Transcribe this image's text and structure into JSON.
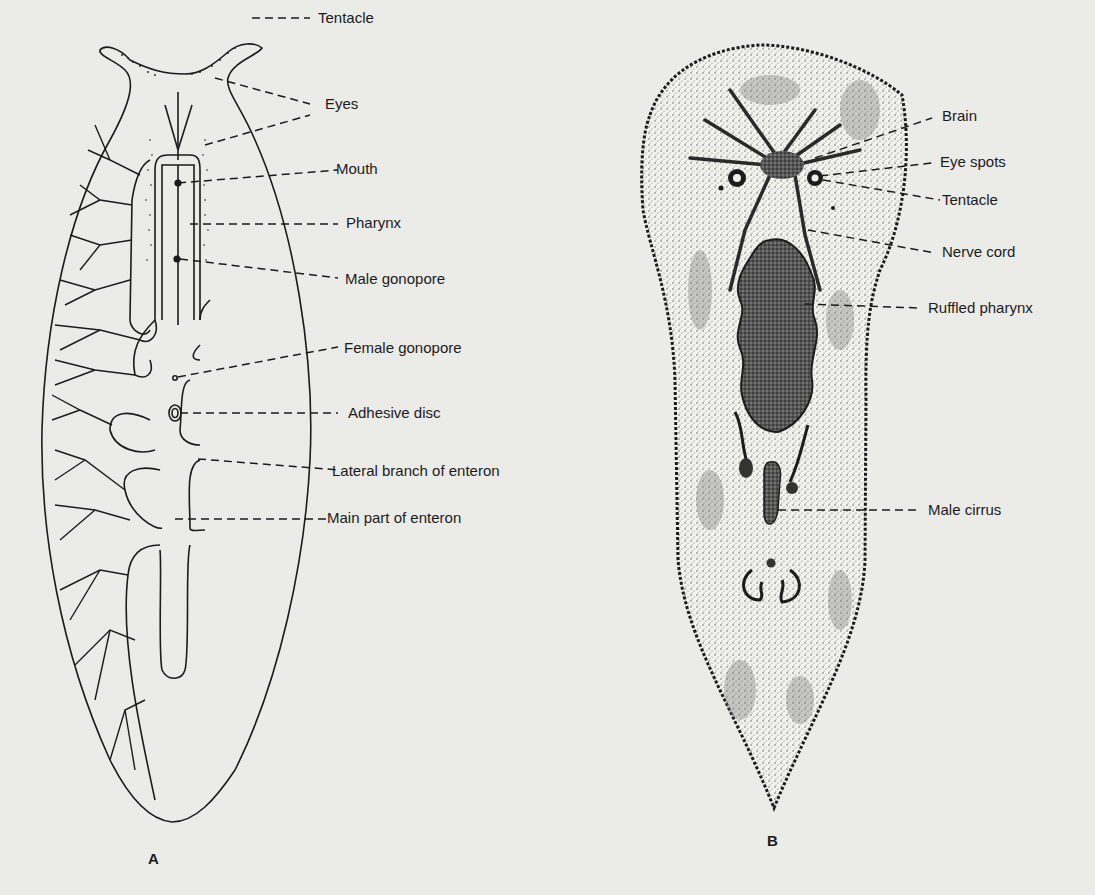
{
  "figure": {
    "panel_a": {
      "letter": "A",
      "labels": [
        {
          "id": "tentacle",
          "text": "Tentacle"
        },
        {
          "id": "eyes",
          "text": "Eyes"
        },
        {
          "id": "mouth",
          "text": "Mouth"
        },
        {
          "id": "pharynx",
          "text": "Pharynx"
        },
        {
          "id": "male-gonopore",
          "text": "Male gonopore"
        },
        {
          "id": "female-gonopore",
          "text": "Female gonopore"
        },
        {
          "id": "adhesive-disc",
          "text": "Adhesive disc"
        },
        {
          "id": "lateral-branch",
          "text": "Lateral branch of enteron"
        },
        {
          "id": "main-enteron",
          "text": "Main part of enteron"
        }
      ]
    },
    "panel_b": {
      "letter": "B",
      "labels": [
        {
          "id": "brain",
          "text": "Brain"
        },
        {
          "id": "eye-spots",
          "text": "Eye spots"
        },
        {
          "id": "tentacle",
          "text": "Tentacle"
        },
        {
          "id": "nerve-cord",
          "text": "Nerve cord"
        },
        {
          "id": "ruffled-pharynx",
          "text": "Ruffled pharynx"
        },
        {
          "id": "male-cirrus",
          "text": "Male cirrus"
        }
      ]
    },
    "colors": {
      "paper": "#ebebe8",
      "ink": "#1c1c1c",
      "stipple": "#8a8a86"
    }
  }
}
